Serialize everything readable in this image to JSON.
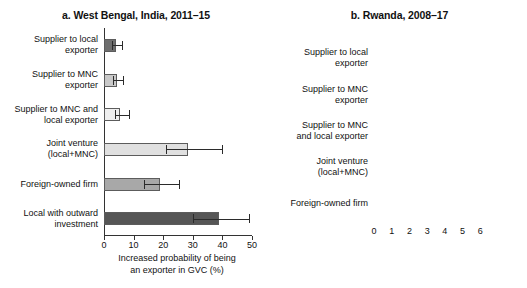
{
  "chart_data": [
    {
      "type": "bar",
      "orientation": "horizontal",
      "title": "a. West Bengal, India, 2011–15",
      "xlabel": "Increased probability of being\nan exporter in GVC (%)",
      "ylabel": "",
      "categories": [
        "Supplier to local\nexporter",
        "Supplier to MNC\nexporter",
        "Supplier to MNC and\nlocal exporter",
        "Joint venture\n(local+MNC)",
        "Foreign-owned firm",
        "Local with outward\ninvestment"
      ],
      "values": [
        4.0,
        4.5,
        5.5,
        28.5,
        19.0,
        39.0
      ],
      "error_low": [
        2.8,
        3.2,
        3.6,
        21.0,
        13.5,
        30.0
      ],
      "error_high": [
        6.0,
        6.4,
        8.6,
        40.0,
        25.5,
        49.0
      ],
      "bar_colors": [
        "#6e6e6e",
        "#c9c9c9",
        "#efefef",
        "#e0e0e0",
        "#a8a8a8",
        "#565656"
      ],
      "xlim": [
        0,
        50
      ],
      "xticks": [
        0,
        10,
        20,
        30,
        40,
        50
      ],
      "xticklabels": [
        "0",
        "10",
        "20",
        "30",
        "40",
        "50"
      ],
      "grid": false,
      "legend": "none"
    },
    {
      "type": "bar",
      "orientation": "horizontal",
      "title": "b. Rwanda, 2008–17",
      "xlabel": "Increased probability of being\nan exporter in GVC (%)",
      "ylabel": "",
      "categories": [
        "Supplier to local\nexporter",
        "Supplier to MNC\nexporter",
        "Supplier to MNC\nand local exporter",
        "Joint venture\n(local+MNC)",
        "Foreign-owned firm"
      ],
      "values": [
        1.5,
        1.4,
        1.5,
        5.0,
        6.4
      ],
      "error_low": [
        1.2,
        1.0,
        1.1,
        4.1,
        6.0
      ],
      "error_high": [
        1.8,
        1.8,
        2.0,
        5.9,
        6.8
      ],
      "bar_colors": [
        "#6e6e6e",
        "#c9c9c9",
        "#efefef",
        "#dcdcdc",
        "#c4c4c4"
      ],
      "xlim": [
        0,
        7
      ],
      "xticks": [
        0,
        1,
        2,
        3,
        4,
        5,
        6
      ],
      "xticklabels": [
        "0",
        "1",
        "2",
        "3",
        "4",
        "5",
        "6"
      ],
      "grid": false,
      "legend": "none"
    }
  ]
}
